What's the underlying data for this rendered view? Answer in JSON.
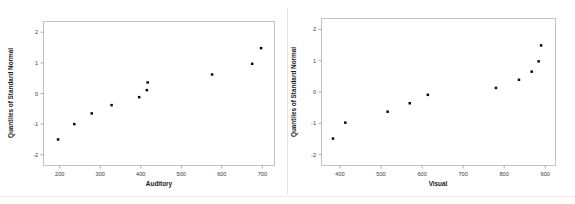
{
  "figure": {
    "title": "",
    "background_color": "#ffffff",
    "point_color": "#0a0a0a",
    "frame_color": "#bdbdbd",
    "panel_count": 2
  },
  "chart_data": [
    {
      "type": "scatter",
      "title": "",
      "subtitle": "",
      "xlabel": "Auditory",
      "ylabel": "Quantiles of Standard Normal",
      "xlim": [
        160,
        730
      ],
      "ylim": [
        -2.35,
        2.35
      ],
      "xticks": [
        200,
        300,
        400,
        500,
        600,
        700
      ],
      "xtick_labels": [
        "200",
        "300",
        "400",
        "500",
        "600",
        "700"
      ],
      "yticks": [
        -2,
        -1,
        0,
        1,
        2
      ],
      "ytick_labels": [
        "-2",
        "-1",
        "0",
        "1",
        "2"
      ],
      "grid": false,
      "legend": false,
      "legend_position": "none",
      "marker": "filled-square",
      "x": [
        196,
        236,
        279,
        328,
        396,
        415,
        417,
        576,
        675,
        697
      ],
      "y": [
        -1.5,
        -1.0,
        -0.65,
        -0.38,
        -0.12,
        0.11,
        0.36,
        0.62,
        0.97,
        1.48
      ],
      "n_points": 10
    },
    {
      "type": "scatter",
      "title": "",
      "subtitle": "",
      "xlabel": "Visual",
      "ylabel": "Quantiles of Standard Normal",
      "xlim": [
        355,
        925
      ],
      "ylim": [
        -2.35,
        2.35
      ],
      "xticks": [
        400,
        500,
        600,
        700,
        800,
        900
      ],
      "xtick_labels": [
        "400",
        "500",
        "600",
        "700",
        "800",
        "900"
      ],
      "yticks": [
        -2,
        -1,
        0,
        1,
        2
      ],
      "ytick_labels": [
        "-2",
        "-1",
        "0",
        "1",
        "2"
      ],
      "grid": false,
      "legend": false,
      "legend_position": "none",
      "marker": "filled-square",
      "x": [
        383,
        413,
        516,
        570,
        614,
        780,
        836,
        867,
        884,
        890
      ],
      "y": [
        -1.49,
        -0.98,
        -0.63,
        -0.36,
        -0.09,
        0.13,
        0.39,
        0.65,
        0.98,
        1.49
      ],
      "n_points": 10
    }
  ]
}
